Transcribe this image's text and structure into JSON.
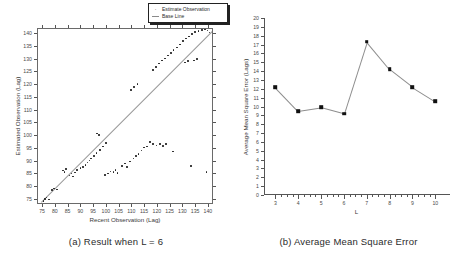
{
  "figure": {
    "panel_a": {
      "caption": "(a) Result when L = 6",
      "legend": {
        "items": [
          {
            "label": "Estimate Observation",
            "marker": "dot"
          },
          {
            "label": "Base Line",
            "marker": "line"
          }
        ]
      }
    },
    "panel_b": {
      "caption": "(b) Average Mean Square Error"
    }
  },
  "chart_data": [
    {
      "type": "scatter",
      "panel": "a",
      "title": "",
      "xlabel": "Recent Observation (Lag)",
      "ylabel": "Estimated Observation (Lag)",
      "xlim": [
        73,
        142
      ],
      "ylim": [
        73,
        142
      ],
      "xticks": [
        75,
        80,
        85,
        90,
        95,
        100,
        105,
        110,
        115,
        120,
        125,
        130,
        135,
        140
      ],
      "yticks": [
        75,
        80,
        85,
        90,
        95,
        100,
        105,
        110,
        115,
        120,
        125,
        130,
        135,
        140
      ],
      "grid": false,
      "legend_position": "top-right",
      "legend": [
        "Estimate Observation",
        "Base Line"
      ],
      "series": [
        {
          "name": "Estimate Observation",
          "marker": "dot",
          "points": [
            [
              75.2,
              74.6
            ],
            [
              75.8,
              75.4
            ],
            [
              76.4,
              76.0
            ],
            [
              77.4,
              75.2
            ],
            [
              78.6,
              78.8
            ],
            [
              79.2,
              79.4
            ],
            [
              80.4,
              79.0
            ],
            [
              82.8,
              86.5
            ],
            [
              83.4,
              86.0
            ],
            [
              84.0,
              87.0
            ],
            [
              85.4,
              84.6
            ],
            [
              86.2,
              85.4
            ],
            [
              86.8,
              84.2
            ],
            [
              87.6,
              85.8
            ],
            [
              88.4,
              86.8
            ],
            [
              89.6,
              87.4
            ],
            [
              90.6,
              88.0
            ],
            [
              91.6,
              88.6
            ],
            [
              92.4,
              89.6
            ],
            [
              93.2,
              90.4
            ],
            [
              93.8,
              91.2
            ],
            [
              95.0,
              92.2
            ],
            [
              96.0,
              93.4
            ],
            [
              97.2,
              94.6
            ],
            [
              98.6,
              96.0
            ],
            [
              99.6,
              97.2
            ],
            [
              96.2,
              101.0
            ],
            [
              97.0,
              100.4
            ],
            [
              99.2,
              84.8
            ],
            [
              100.4,
              85.4
            ],
            [
              101.4,
              86.2
            ],
            [
              102.6,
              86.0
            ],
            [
              103.4,
              86.8
            ],
            [
              104.2,
              85.6
            ],
            [
              106.0,
              88.4
            ],
            [
              107.2,
              89.2
            ],
            [
              108.0,
              88.0
            ],
            [
              109.0,
              90.0
            ],
            [
              110.4,
              91.2
            ],
            [
              111.4,
              92.2
            ],
            [
              112.4,
              93.0
            ],
            [
              113.6,
              94.4
            ],
            [
              114.6,
              95.6
            ],
            [
              115.8,
              96.0
            ],
            [
              117.0,
              97.6
            ],
            [
              118.2,
              97.0
            ],
            [
              119.4,
              96.4
            ],
            [
              120.8,
              96.8
            ],
            [
              122.0,
              96.2
            ],
            [
              123.2,
              97.0
            ],
            [
              118.0,
              126.0
            ],
            [
              119.2,
              127.2
            ],
            [
              120.4,
              128.4
            ],
            [
              121.6,
              129.6
            ],
            [
              122.8,
              130.4
            ],
            [
              124.0,
              131.6
            ],
            [
              125.2,
              132.6
            ],
            [
              126.2,
              133.8
            ],
            [
              127.4,
              134.8
            ],
            [
              128.6,
              136.0
            ],
            [
              129.8,
              137.2
            ],
            [
              131.0,
              138.2
            ],
            [
              132.2,
              139.0
            ],
            [
              133.4,
              140.0
            ],
            [
              134.6,
              140.8
            ],
            [
              136.0,
              141.2
            ],
            [
              137.2,
              141.6
            ],
            [
              138.4,
              141.8
            ],
            [
              139.4,
              141.4
            ],
            [
              140.2,
              140.6
            ],
            [
              130.6,
              128.8
            ],
            [
              131.8,
              129.4
            ],
            [
              134.2,
              129.6
            ],
            [
              135.4,
              130.2
            ],
            [
              126.0,
              94.0
            ],
            [
              133.0,
              88.2
            ],
            [
              139.0,
              86.0
            ],
            [
              109.4,
              118.0
            ],
            [
              110.6,
              119.2
            ],
            [
              112.0,
              120.4
            ]
          ]
        },
        {
          "name": "Base Line",
          "type": "line",
          "points": [
            [
              74.0,
              74.0
            ],
            [
              141.0,
              141.0
            ]
          ]
        }
      ]
    },
    {
      "type": "line",
      "panel": "b",
      "title": "",
      "xlabel": "L",
      "ylabel": "Average Mean Square Error (Lags)",
      "xlim": [
        2.5,
        10.6
      ],
      "ylim": [
        0,
        20
      ],
      "xticks": [
        3,
        4,
        5,
        6,
        7,
        8,
        9,
        10
      ],
      "yticks": [
        0,
        1,
        2,
        3,
        4,
        5,
        6,
        7,
        8,
        9,
        10,
        11,
        12,
        13,
        14,
        15,
        16,
        17,
        18,
        19,
        20
      ],
      "grid": false,
      "marker": "square",
      "categories": [
        3,
        4,
        5,
        6,
        7,
        8,
        9,
        10
      ],
      "values": [
        12.2,
        9.5,
        9.9,
        9.2,
        17.3,
        14.2,
        12.2,
        10.6
      ]
    }
  ]
}
